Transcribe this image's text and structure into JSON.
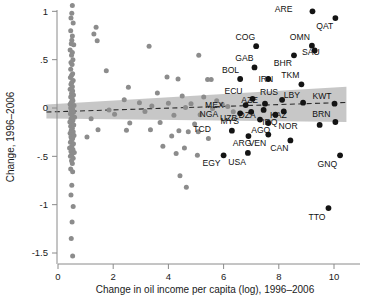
{
  "chart_data": {
    "type": "scatter",
    "title": "",
    "xlabel": "Change in oil income per capita (log), 1996–2006",
    "ylabel": "Change, 1996–2006",
    "xlim": [
      -0.45,
      11.2
    ],
    "ylim": [
      -1.62,
      1.18
    ],
    "xticks": [
      0,
      2,
      4,
      6,
      8,
      10
    ],
    "xtick_labels": [
      "0",
      "2",
      "4",
      "6",
      "8",
      "10"
    ],
    "yticks": [
      1,
      0.5,
      0,
      -0.5,
      -1,
      -1.5
    ],
    "ytick_labels": [
      "1",
      ".5",
      "0",
      "-.5",
      "-1",
      "-1.5"
    ],
    "grid": false,
    "legend": "none",
    "colors": {
      "unlabeled_point": "#8c8c8c",
      "labeled_point": "#141414",
      "confidence_band": "#bdbdbd",
      "fit_line": "#2b2b2b",
      "axis": "#8a8a8a",
      "text": "#111111",
      "background": "#ffffff"
    },
    "fit_line": {
      "style": "dashed",
      "x_start": -0.42,
      "y_start": -0.042,
      "x_end": 10.45,
      "y_end": 0.058
    },
    "confidence_band": {
      "description": "shaded 95% confidence interval around dashed fit line",
      "x_start": -0.42,
      "x_end": 10.45,
      "upper_start": 0.035,
      "lower_start": -0.108,
      "upper_end": 0.22,
      "lower_end": -0.145
    },
    "labeled_series": {
      "name": "Oil producing countries",
      "points": [
        {
          "label": "ARE",
          "x": 9.22,
          "y": 1.0,
          "label_dx": -20,
          "label_dy": 1
        },
        {
          "label": "QAT",
          "x": 10.05,
          "y": 0.93,
          "label_dx": -2,
          "label_dy": 11
        },
        {
          "label": "COG",
          "x": 7.18,
          "y": 0.64,
          "label_dx": -1,
          "label_dy": -6
        },
        {
          "label": "OMN",
          "x": 9.2,
          "y": 0.645,
          "label_dx": -2,
          "label_dy": -6
        },
        {
          "label": "SAU",
          "x": 9.3,
          "y": 0.595,
          "label_dx": 5,
          "label_dy": 5
        },
        {
          "label": "BHR",
          "x": 8.55,
          "y": 0.545,
          "label_dx": -2,
          "label_dy": 11
        },
        {
          "label": "GAB",
          "x": 7.12,
          "y": 0.42,
          "label_dx": -1,
          "label_dy": -6
        },
        {
          "label": "BOL",
          "x": 6.6,
          "y": 0.3,
          "label_dx": -1,
          "label_dy": -6
        },
        {
          "label": "IRN",
          "x": 7.62,
          "y": 0.3,
          "label_dx": 5,
          "label_dy": 3
        },
        {
          "label": "TKM",
          "x": 8.82,
          "y": 0.245,
          "label_dx": -2,
          "label_dy": -6
        },
        {
          "label": "ECU",
          "x": 7.05,
          "y": 0.095,
          "label_dx": -10,
          "label_dy": -5
        },
        {
          "label": "RUS",
          "x": 8.12,
          "y": 0.085,
          "label_dx": -4,
          "label_dy": -5
        },
        {
          "label": "LBY",
          "x": 8.88,
          "y": 0.055,
          "label_dx": -3,
          "label_dy": -5
        },
        {
          "label": "KWT",
          "x": 10.02,
          "y": 0.045,
          "label_dx": -3,
          "label_dy": -5
        },
        {
          "label": "MEX",
          "x": 6.8,
          "y": 0.03,
          "label_dx": -22,
          "label_dy": 3
        },
        {
          "label": "AZE",
          "x": 7.5,
          "y": 0.045,
          "label_dx": -7,
          "label_dy": -1
        },
        {
          "label": "UZB",
          "x": 7.0,
          "y": -0.04,
          "label_dx": -14,
          "label_dy": 9
        },
        {
          "label": "DZA",
          "x": 7.45,
          "y": -0.02,
          "label_dx": -8,
          "label_dy": 8
        },
        {
          "label": "KAZ",
          "x": 8.18,
          "y": -0.035,
          "label_dx": 3,
          "label_dy": 7
        },
        {
          "label": "NGA",
          "x": 6.6,
          "y": -0.055,
          "label_dx": -22,
          "label_dy": 4
        },
        {
          "label": "IRQ",
          "x": 7.88,
          "y": -0.07,
          "label_dx": 2,
          "label_dy": 10
        },
        {
          "label": "BRN",
          "x": 10.05,
          "y": -0.145,
          "label_dx": -5,
          "label_dy": -5
        },
        {
          "label": "NOR",
          "x": 9.48,
          "y": -0.175,
          "label_dx": -22,
          "label_dy": 4
        },
        {
          "label": "MYS",
          "x": 7.32,
          "y": -0.12,
          "label_dx": -21,
          "label_dy": 4
        },
        {
          "label": "AGO",
          "x": 7.62,
          "y": -0.155,
          "label_dx": 2,
          "label_dy": 10
        },
        {
          "label": "TCD",
          "x": 6.3,
          "y": -0.235,
          "label_dx": -21,
          "label_dy": 1
        },
        {
          "label": "ARG",
          "x": 6.9,
          "y": -0.29,
          "label_dx": 3,
          "label_dy": 10
        },
        {
          "label": "VEN",
          "x": 7.62,
          "y": -0.275,
          "label_dx": -2,
          "label_dy": 11
        },
        {
          "label": "CAN",
          "x": 8.42,
          "y": -0.335,
          "label_dx": -2,
          "label_dy": 11
        },
        {
          "label": "EGY",
          "x": 6.0,
          "y": -0.49,
          "label_dx": -3,
          "label_dy": 11
        },
        {
          "label": "USA",
          "x": 6.88,
          "y": -0.465,
          "label_dx": -2,
          "label_dy": 12
        },
        {
          "label": "GNQ",
          "x": 10.22,
          "y": -0.49,
          "label_dx": -3,
          "label_dy": 12
        },
        {
          "label": "TTO",
          "x": 9.8,
          "y": -1.035,
          "label_dx": -3,
          "label_dy": 12
        }
      ]
    },
    "unlabeled_series": {
      "name": "Other countries",
      "points": [
        [
          0.52,
          1.06
        ],
        [
          0.5,
          0.98
        ],
        [
          0.47,
          0.93
        ],
        [
          0.55,
          0.88
        ],
        [
          1.38,
          0.835
        ],
        [
          0.46,
          0.8
        ],
        [
          1.3,
          0.765
        ],
        [
          0.52,
          0.745
        ],
        [
          0.5,
          0.7
        ],
        [
          1.42,
          0.695
        ],
        [
          0.48,
          0.665
        ],
        [
          0.57,
          0.655
        ],
        [
          3.3,
          0.64
        ],
        [
          0.44,
          0.6
        ],
        [
          0.52,
          0.575
        ],
        [
          0.49,
          0.545
        ],
        [
          5.1,
          0.545
        ],
        [
          0.54,
          0.5
        ],
        [
          0.47,
          0.47
        ],
        [
          0.51,
          0.45
        ],
        [
          1.75,
          0.385
        ],
        [
          0.46,
          0.4
        ],
        [
          0.53,
          0.355
        ],
        [
          0.49,
          0.335
        ],
        [
          3.95,
          0.32
        ],
        [
          0.45,
          0.315
        ],
        [
          4.35,
          0.3
        ],
        [
          5.42,
          0.295
        ],
        [
          5.55,
          0.295
        ],
        [
          0.55,
          0.285
        ],
        [
          0.5,
          0.265
        ],
        [
          0.47,
          0.245
        ],
        [
          0.52,
          0.22
        ],
        [
          2.55,
          0.215
        ],
        [
          0.44,
          0.195
        ],
        [
          0.53,
          0.175
        ],
        [
          3.6,
          0.155
        ],
        [
          0.49,
          0.15
        ],
        [
          0.56,
          0.135
        ],
        [
          4.5,
          0.125
        ],
        [
          0.46,
          0.115
        ],
        [
          5.28,
          0.115
        ],
        [
          0.51,
          0.1
        ],
        [
          2.4,
          0.085
        ],
        [
          5.75,
          0.075
        ],
        [
          0.54,
          0.075
        ],
        [
          0.48,
          0.06
        ],
        [
          2.95,
          0.055
        ],
        [
          4.0,
          0.05
        ],
        [
          4.82,
          0.045
        ],
        [
          5.95,
          0.04
        ],
        [
          0.44,
          0.04
        ],
        [
          0.58,
          0.025
        ],
        [
          0.5,
          0.015
        ],
        [
          3.4,
          0.02
        ],
        [
          6.15,
          0.015
        ],
        [
          0.46,
          0.0
        ],
        [
          4.62,
          0.005
        ],
        [
          5.6,
          -0.005
        ],
        [
          0.53,
          -0.015
        ],
        [
          1.85,
          -0.02
        ],
        [
          0.49,
          -0.03
        ],
        [
          3.15,
          -0.035
        ],
        [
          6.35,
          -0.04
        ],
        [
          0.56,
          -0.045
        ],
        [
          0.45,
          -0.06
        ],
        [
          2.05,
          -0.065
        ],
        [
          4.2,
          -0.075
        ],
        [
          5.15,
          -0.07
        ],
        [
          0.51,
          -0.08
        ],
        [
          0.6,
          -0.095
        ],
        [
          1.2,
          -0.11
        ],
        [
          0.47,
          -0.115
        ],
        [
          0.54,
          -0.13
        ],
        [
          0.43,
          -0.145
        ],
        [
          2.6,
          -0.155
        ],
        [
          3.7,
          -0.15
        ],
        [
          0.5,
          -0.16
        ],
        [
          4.95,
          -0.165
        ],
        [
          0.57,
          -0.175
        ],
        [
          0.46,
          -0.19
        ],
        [
          1.45,
          -0.225
        ],
        [
          2.48,
          -0.23
        ],
        [
          3.35,
          -0.225
        ],
        [
          0.52,
          -0.21
        ],
        [
          0.48,
          -0.23
        ],
        [
          4.38,
          -0.235
        ],
        [
          0.55,
          -0.245
        ],
        [
          4.72,
          -0.245
        ],
        [
          0.44,
          -0.26
        ],
        [
          5.08,
          -0.245
        ],
        [
          0.51,
          -0.275
        ],
        [
          0.58,
          -0.285
        ],
        [
          4.12,
          -0.29
        ],
        [
          0.47,
          -0.3
        ],
        [
          1.05,
          -0.3
        ],
        [
          0.53,
          -0.315
        ],
        [
          5.45,
          -0.315
        ],
        [
          0.49,
          -0.335
        ],
        [
          0.45,
          -0.355
        ],
        [
          0.56,
          -0.37
        ],
        [
          3.8,
          -0.395
        ],
        [
          0.5,
          -0.395
        ],
        [
          0.42,
          -0.415
        ],
        [
          4.58,
          -0.415
        ],
        [
          0.54,
          -0.43
        ],
        [
          0.47,
          -0.45
        ],
        [
          0.59,
          -0.46
        ],
        [
          4.28,
          -0.47
        ],
        [
          0.51,
          -0.475
        ],
        [
          5.05,
          -0.49
        ],
        [
          0.45,
          -0.5
        ],
        [
          0.55,
          -0.52
        ],
        [
          0.49,
          -0.545
        ],
        [
          0.52,
          -0.575
        ],
        [
          4.42,
          -0.7
        ],
        [
          0.46,
          -0.63
        ],
        [
          0.53,
          -0.66
        ],
        [
          4.65,
          -0.82
        ],
        [
          0.5,
          -0.8
        ],
        [
          0.47,
          -0.9
        ],
        [
          0.55,
          -1.02
        ],
        [
          0.51,
          -1.18
        ],
        [
          0.48,
          -1.35
        ],
        [
          0.53,
          -1.53
        ]
      ]
    }
  }
}
